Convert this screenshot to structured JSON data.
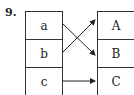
{
  "problem_number": "9.",
  "left_column": {
    "items": [
      "a",
      "b",
      "c"
    ]
  },
  "right_column": {
    "items": [
      "A",
      "B",
      "C"
    ]
  },
  "mappings": [
    {
      "from": "a",
      "to": "B"
    },
    {
      "from": "b",
      "to": "A"
    },
    {
      "from": "c",
      "to": "C"
    }
  ]
}
